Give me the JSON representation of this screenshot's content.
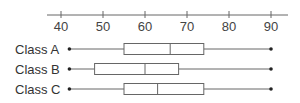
{
  "chart_data": {
    "type": "boxplot",
    "title": "",
    "xlabel": "",
    "ylabel": "",
    "orientation": "horizontal",
    "axis_position": "top",
    "xlim": [
      40,
      90
    ],
    "ticks": [
      40,
      50,
      60,
      70,
      80,
      90
    ],
    "tick_labels": [
      "40",
      "50",
      "60",
      "70",
      "80",
      "90"
    ],
    "grid": false,
    "legend": null,
    "categories": [
      "Class A",
      "Class B",
      "Class C"
    ],
    "series": [
      {
        "name": "Class A",
        "min": 42,
        "q1": 55,
        "median": 66,
        "q3": 74,
        "max": 90
      },
      {
        "name": "Class B",
        "min": 42,
        "q1": 48,
        "median": 60,
        "q3": 68,
        "max": 90
      },
      {
        "name": "Class C",
        "min": 42,
        "q1": 55,
        "median": 63,
        "q3": 74,
        "max": 90
      }
    ]
  },
  "style": {
    "line_color": "#666666",
    "box_fill": "#ffffff",
    "dot_color": "#222222"
  }
}
